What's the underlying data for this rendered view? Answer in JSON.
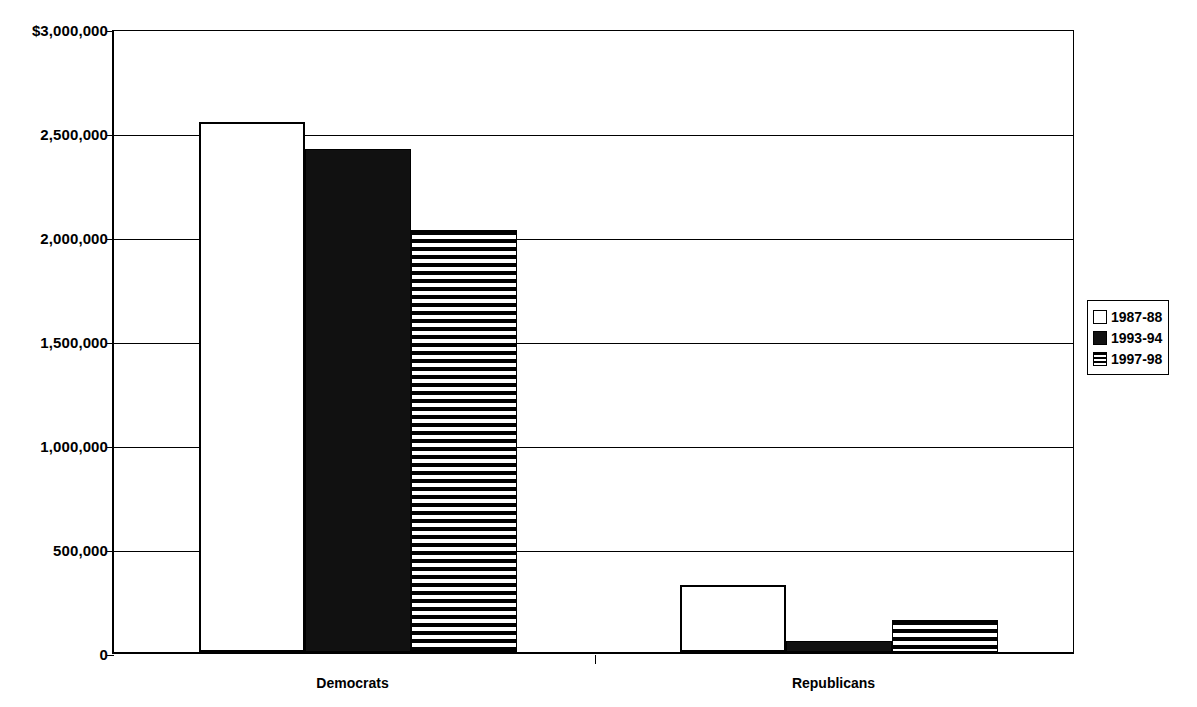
{
  "chart_data": {
    "type": "bar",
    "title": "",
    "subtitle": "",
    "xlabel": "",
    "ylabel": "",
    "categories": [
      "Democrats",
      "Republicans"
    ],
    "series": [
      {
        "name": "1987-88",
        "values": [
          2550000,
          320000
        ],
        "fill": "empty"
      },
      {
        "name": "1993-94",
        "values": [
          2420000,
          55000
        ],
        "fill": "solid"
      },
      {
        "name": "1997-98",
        "values": [
          2030000,
          155000
        ],
        "fill": "striped"
      }
    ],
    "ylim": [
      0,
      3000000
    ],
    "ytick_values": [
      3000000,
      2500000,
      2000000,
      1500000,
      1000000,
      500000,
      0
    ],
    "ytick_labels": [
      "$3,000,000",
      "2,500,000",
      "2,000,000",
      "1,500,000",
      "1,000,000",
      "500,000",
      "0"
    ],
    "grid": true,
    "grid_axis": "y",
    "legend_position": "right",
    "colors": {
      "axis": "#000000",
      "grid": "#000000",
      "bar_empty": "#ffffff",
      "bar_solid": "#111111",
      "bar_striped": "#000000",
      "background": "#ffffff"
    }
  },
  "y_axis": {
    "ticks": [
      {
        "label": "$3,000,000",
        "value": 3000000
      },
      {
        "label": "2,500,000",
        "value": 2500000
      },
      {
        "label": "2,000,000",
        "value": 2000000
      },
      {
        "label": "1,500,000",
        "value": 1500000
      },
      {
        "label": "1,000,000",
        "value": 1000000
      },
      {
        "label": "500,000",
        "value": 500000
      },
      {
        "label": "0",
        "value": 0
      }
    ]
  },
  "x_axis": {
    "categories": [
      {
        "label": "Democrats"
      },
      {
        "label": "Republicans"
      }
    ]
  },
  "legend": {
    "items": [
      {
        "label": "1987-88",
        "fill": "empty"
      },
      {
        "label": "1993-94",
        "fill": "solid"
      },
      {
        "label": "1997-98",
        "fill": "striped"
      }
    ]
  }
}
